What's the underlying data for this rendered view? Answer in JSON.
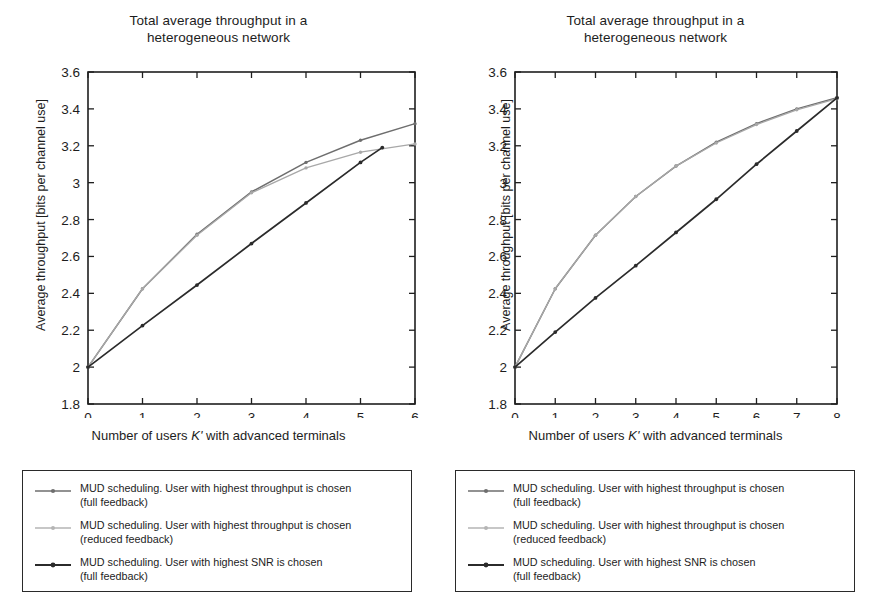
{
  "figure": {
    "panel_count": 2
  },
  "chart_data": [
    {
      "type": "line",
      "panel": "left",
      "title": "Total average throughput in a heterogeneous network",
      "title_lines": [
        "Total average throughput in a",
        "heterogeneous network"
      ],
      "xlabel": "Number of users K' with advanced terminals",
      "xlabel_prefix": "Number of users ",
      "xlabel_symbol": "K'",
      "xlabel_suffix": " with advanced terminals",
      "ylabel": "Average throughput [bits per channel use]",
      "xlim": [
        0,
        6
      ],
      "ylim": [
        1.8,
        3.6
      ],
      "xticks": [
        0,
        1,
        2,
        3,
        4,
        5,
        6
      ],
      "xticklabels": [
        "0",
        "1",
        "2",
        "3",
        "4",
        "5",
        "6"
      ],
      "yticks": [
        1.8,
        2,
        2.2,
        2.4,
        2.6,
        2.8,
        3,
        3.2,
        3.4,
        3.6
      ],
      "yticklabels": [
        "1.8",
        "2",
        "2.2",
        "2.4",
        "2.6",
        "2.8",
        "3",
        "3.2",
        "3.4",
        "3.6"
      ],
      "grid": false,
      "legend_position": "below",
      "series": [
        {
          "name": "MUD scheduling. User with highest throughput is chosen (full feedback)",
          "color": "#6e6e6e",
          "marker": "dot",
          "x": [
            0,
            1,
            2,
            3,
            4,
            5,
            6
          ],
          "values": [
            2.0,
            2.425,
            2.72,
            2.95,
            3.11,
            3.23,
            3.32
          ]
        },
        {
          "name": "MUD scheduling. User with highest throughput is chosen (reduced feedback)",
          "color": "#a8a8a8",
          "marker": "dot",
          "x": [
            0,
            1,
            2,
            3,
            4,
            5,
            6
          ],
          "values": [
            2.0,
            2.425,
            2.715,
            2.945,
            3.08,
            3.165,
            3.21
          ]
        },
        {
          "name": "MUD scheduling. User with highest SNR is chosen (full feedback)",
          "color": "#2b2b2b",
          "marker": "dot",
          "x": [
            0,
            1,
            2,
            3,
            4,
            5,
            5.4
          ],
          "values": [
            2.0,
            2.225,
            2.445,
            2.67,
            2.89,
            3.11,
            3.19
          ]
        }
      ]
    },
    {
      "type": "line",
      "panel": "right",
      "title": "Total average throughput in a heterogeneous network",
      "title_lines": [
        "Total average throughput in a",
        "heterogeneous network"
      ],
      "xlabel": "Number of users K' with advanced terminals",
      "xlabel_prefix": "Number of users ",
      "xlabel_symbol": "K'",
      "xlabel_suffix": " with advanced terminals",
      "ylabel": "Average throughput [bits per channel use]",
      "xlim": [
        0,
        8
      ],
      "ylim": [
        1.8,
        3.6
      ],
      "xticks": [
        0,
        1,
        2,
        3,
        4,
        5,
        6,
        7,
        8
      ],
      "xticklabels": [
        "0",
        "1",
        "2",
        "3",
        "4",
        "5",
        "6",
        "7",
        "8"
      ],
      "yticks": [
        1.8,
        2,
        2.2,
        2.4,
        2.6,
        2.8,
        3,
        3.2,
        3.4,
        3.6
      ],
      "yticklabels": [
        "1.8",
        "2",
        "2.2",
        "2.4",
        "2.6",
        "2.8",
        "3",
        "3.2",
        "3.4",
        "3.6"
      ],
      "grid": false,
      "legend_position": "below",
      "series": [
        {
          "name": "MUD scheduling. User with highest throughput is chosen (full feedback)",
          "color": "#6e6e6e",
          "marker": "dot",
          "x": [
            0,
            1,
            2,
            3,
            4,
            5,
            6,
            7,
            8
          ],
          "values": [
            2.0,
            2.425,
            2.715,
            2.925,
            3.09,
            3.22,
            3.32,
            3.4,
            3.46
          ]
        },
        {
          "name": "MUD scheduling. User with highest throughput is chosen (reduced feedback)",
          "color": "#a8a8a8",
          "marker": "dot",
          "x": [
            0,
            1,
            2,
            3,
            4,
            5,
            6,
            7,
            8
          ],
          "values": [
            2.0,
            2.425,
            2.715,
            2.925,
            3.09,
            3.215,
            3.315,
            3.395,
            3.455
          ]
        },
        {
          "name": "MUD scheduling. User with highest SNR is chosen (full feedback)",
          "color": "#2b2b2b",
          "marker": "dot",
          "x": [
            0,
            1,
            2,
            3,
            4,
            5,
            6,
            7,
            8
          ],
          "values": [
            2.0,
            2.19,
            2.375,
            2.55,
            2.73,
            2.91,
            3.1,
            3.28,
            3.46
          ]
        }
      ]
    }
  ],
  "legends": {
    "left": {
      "entries": [
        {
          "line1": "MUD scheduling. User with highest throughput is chosen",
          "line2": "(full feedback)",
          "color": "#6e6e6e"
        },
        {
          "line1": "MUD scheduling. User with highest throughput is chosen",
          "line2": "(reduced feedback)",
          "color": "#a8a8a8"
        },
        {
          "line1": "MUD scheduling. User with highest SNR is chosen",
          "line2": "(full feedback)",
          "color": "#2b2b2b"
        }
      ]
    },
    "right": {
      "entries": [
        {
          "line1": "MUD scheduling. User with highest throughput is chosen",
          "line2": "(full feedback)",
          "color": "#6e6e6e"
        },
        {
          "line1": "MUD scheduling. User with highest throughput is chosen",
          "line2": "(reduced feedback)",
          "color": "#a8a8a8"
        },
        {
          "line1": "MUD scheduling. User with highest SNR is chosen",
          "line2": "(full feedback)",
          "color": "#2b2b2b"
        }
      ]
    }
  },
  "colors": {
    "axis": "#1f1f1f",
    "background": "#ffffff",
    "series_full": "#6e6e6e",
    "series_reduced": "#a8a8a8",
    "series_snr": "#2b2b2b"
  }
}
